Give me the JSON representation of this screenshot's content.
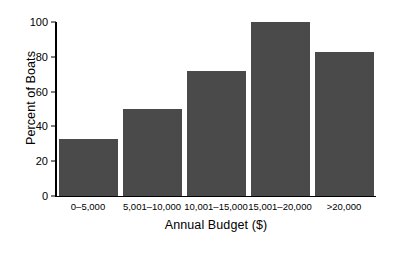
{
  "chart_data": {
    "type": "bar",
    "title": "",
    "xlabel": "Annual Budget ($)",
    "ylabel": "Percent of Boats",
    "categories": [
      "0–5,000",
      "5,001–10,000",
      "10,001–15,000",
      "15,001–20,000",
      ">20,000"
    ],
    "values": [
      33,
      50,
      72,
      100,
      83
    ],
    "ylim": [
      0,
      100
    ],
    "yticks": [
      0,
      20,
      40,
      60,
      80,
      100
    ],
    "ytick_labels": [
      "0",
      "20",
      "40",
      "60",
      "80",
      "100"
    ],
    "grid": false,
    "legend": null,
    "bar_color": "#4a4a4a",
    "axis_color": "#000000",
    "background": "#ffffff"
  },
  "axes": {
    "y_title": "Percent of Boats",
    "x_title": "Annual Budget ($)"
  },
  "bars": [
    {
      "label": "0–5,000",
      "value": 33
    },
    {
      "label": "5,001–10,000",
      "value": 50
    },
    {
      "label": "10,001–15,000",
      "value": 72
    },
    {
      "label": "15,001–20,000",
      "value": 100
    },
    {
      "label": ">20,000",
      "value": 83
    }
  ]
}
